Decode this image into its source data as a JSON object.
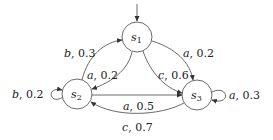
{
  "diagram": {
    "type": "probabilistic-automaton",
    "initial_state": "s1",
    "states": [
      {
        "id": "s1",
        "name": "s",
        "sub": "1",
        "x": 137,
        "y": 37
      },
      {
        "id": "s2",
        "name": "s",
        "sub": "2",
        "x": 77,
        "y": 94
      },
      {
        "id": "s3",
        "name": "s",
        "sub": "3",
        "x": 197,
        "y": 95
      }
    ],
    "transitions": [
      {
        "from": "s2",
        "to": "s1",
        "action": "b",
        "prob": "0.3",
        "label": "b, 0.3"
      },
      {
        "from": "s1",
        "to": "s2",
        "action": "a",
        "prob": "0.2",
        "label": "a, 0.2"
      },
      {
        "from": "s1",
        "to": "s3",
        "action": "a",
        "prob": "0.2",
        "label": "a, 0.2"
      },
      {
        "from": "s1",
        "to": "s3",
        "action": "c",
        "prob": "0.6",
        "label": "c, 0.6"
      },
      {
        "from": "s2",
        "to": "s2",
        "action": "b",
        "prob": "0.2",
        "label": "b, 0.2"
      },
      {
        "from": "s2",
        "to": "s3",
        "action": "a",
        "prob": "0.5",
        "label": "a, 0.5"
      },
      {
        "from": "s3",
        "to": "s3",
        "action": "a",
        "prob": "0.3",
        "label": "a, 0.3"
      },
      {
        "from": "s3",
        "to": "s2",
        "action": "c",
        "prob": "0.7",
        "label": "c, 0.7"
      }
    ]
  },
  "labels": {
    "t0": {
      "act": "b",
      "p": ", 0.3"
    },
    "t1": {
      "act": "a",
      "p": ", 0.2"
    },
    "t2": {
      "act": "a",
      "p": ", 0.2"
    },
    "t3": {
      "act": "c",
      "p": ", 0.6"
    },
    "t4": {
      "act": "b",
      "p": ", 0.2"
    },
    "t5": {
      "act": "a",
      "p": ", 0.5"
    },
    "t6": {
      "act": "a",
      "p": ", 0.3"
    },
    "t7": {
      "act": "c",
      "p": ", 0.7"
    }
  },
  "nodes": {
    "s1": {
      "name": "s",
      "sub": "1"
    },
    "s2": {
      "name": "s",
      "sub": "2"
    },
    "s3": {
      "name": "s",
      "sub": "3"
    }
  }
}
